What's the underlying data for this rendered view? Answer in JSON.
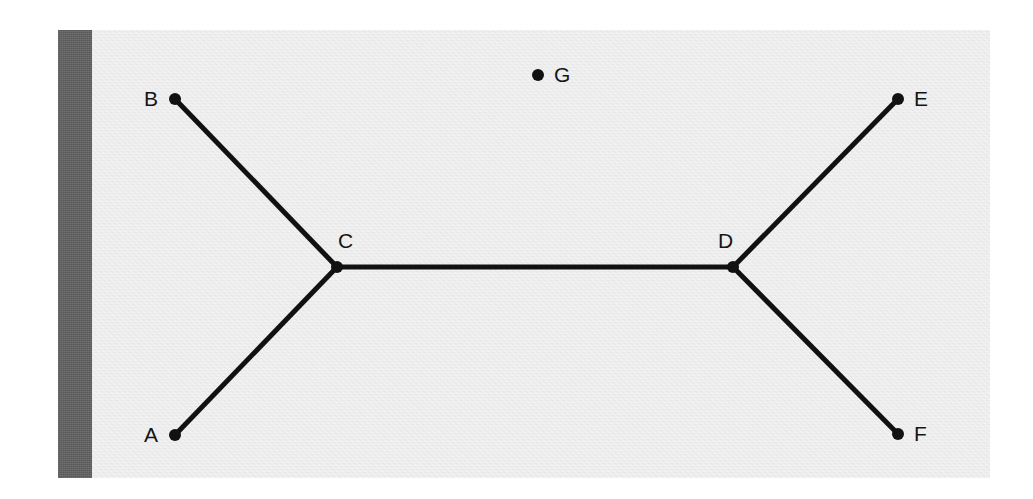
{
  "figure": {
    "canvas": {
      "width": 1033,
      "height": 499,
      "background": "#ffffff"
    },
    "panel": {
      "name": "scan-panel",
      "x": 58,
      "y": 30,
      "width": 932,
      "height": 448,
      "fill": "#e8e8e8"
    },
    "gutter_bar": {
      "name": "binding-gutter-bar",
      "x": 58,
      "y": 30,
      "width": 34,
      "height": 448,
      "fill": "#606060"
    },
    "style": {
      "edge_color": "#111111",
      "edge_width": 5,
      "node_color": "#111111",
      "node_radius": 6,
      "label_color": "#151515",
      "label_font_size": 21
    }
  },
  "chart_data": {
    "type": "diagram",
    "subtype": "node-link-graph",
    "directed": false,
    "nodes": [
      {
        "id": "A",
        "label": "A",
        "x": 175,
        "y": 435,
        "label_x": 144,
        "label_y": 424,
        "degree": 1
      },
      {
        "id": "B",
        "label": "B",
        "x": 175,
        "y": 99,
        "label_x": 144,
        "label_y": 88,
        "degree": 1
      },
      {
        "id": "C",
        "label": "C",
        "x": 337,
        "y": 267,
        "label_x": 338,
        "label_y": 230,
        "degree": 3
      },
      {
        "id": "D",
        "label": "D",
        "x": 733,
        "y": 267,
        "label_x": 718,
        "label_y": 230,
        "degree": 3
      },
      {
        "id": "E",
        "label": "E",
        "x": 898,
        "y": 99,
        "label_x": 914,
        "label_y": 88,
        "degree": 1
      },
      {
        "id": "F",
        "label": "F",
        "x": 898,
        "y": 434,
        "label_x": 914,
        "label_y": 423,
        "degree": 1
      },
      {
        "id": "G",
        "label": "G",
        "x": 538,
        "y": 75,
        "label_x": 554,
        "label_y": 64,
        "degree": 0
      }
    ],
    "edges": [
      {
        "source": "A",
        "target": "C"
      },
      {
        "source": "B",
        "target": "C"
      },
      {
        "source": "C",
        "target": "D"
      },
      {
        "source": "D",
        "target": "E"
      },
      {
        "source": "D",
        "target": "F"
      }
    ],
    "isolated_nodes": [
      "G"
    ],
    "node_count": 7,
    "edge_count": 5
  }
}
